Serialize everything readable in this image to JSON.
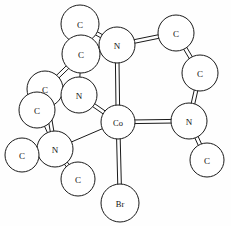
{
  "figure": {
    "kind": "molecular-structure-diagram",
    "center_atom": "Co",
    "axial_ligand": "Br",
    "style": {
      "circle_fill": "#ffffff",
      "stroke": "#1a1a1a",
      "background": "#fefefe"
    }
  },
  "atoms": [
    {
      "id": "C1",
      "label": "C",
      "x": 80,
      "y": 24,
      "r": 19
    },
    {
      "id": "C2",
      "label": "C",
      "x": 81,
      "y": 54,
      "r": 19
    },
    {
      "id": "N1",
      "label": "N",
      "x": 117,
      "y": 45,
      "r": 18
    },
    {
      "id": "C3",
      "label": "C",
      "x": 176,
      "y": 33,
      "r": 18
    },
    {
      "id": "C4",
      "label": "C",
      "x": 200,
      "y": 73,
      "r": 18
    },
    {
      "id": "C5",
      "label": "C",
      "x": 45,
      "y": 89,
      "r": 18
    },
    {
      "id": "C6",
      "label": "C",
      "x": 37,
      "y": 110,
      "r": 18
    },
    {
      "id": "N2",
      "label": "N",
      "x": 79,
      "y": 95,
      "r": 18
    },
    {
      "id": "Co",
      "label": "Co",
      "x": 118,
      "y": 122,
      "r": 17
    },
    {
      "id": "N3",
      "label": "N",
      "x": 189,
      "y": 121,
      "r": 18
    },
    {
      "id": "N4",
      "label": "N",
      "x": 55,
      "y": 149,
      "r": 18
    },
    {
      "id": "C7",
      "label": "C",
      "x": 22,
      "y": 155,
      "r": 17
    },
    {
      "id": "C8",
      "label": "C",
      "x": 78,
      "y": 179,
      "r": 17
    },
    {
      "id": "C9",
      "label": "C",
      "x": 207,
      "y": 160,
      "r": 17
    },
    {
      "id": "Br",
      "label": "Br",
      "x": 120,
      "y": 203,
      "r": 19
    }
  ],
  "bonds": [
    {
      "from": "C1",
      "to": "N1",
      "type": "double"
    },
    {
      "from": "C1",
      "to": "C2",
      "type": "single"
    },
    {
      "from": "C2",
      "to": "N1",
      "type": "double"
    },
    {
      "from": "C2",
      "to": "C5",
      "type": "double"
    },
    {
      "from": "C2",
      "to": "N2",
      "type": "single"
    },
    {
      "from": "N1",
      "to": "C3",
      "type": "double"
    },
    {
      "from": "N1",
      "to": "Co",
      "type": "double"
    },
    {
      "from": "C3",
      "to": "C4",
      "type": "double"
    },
    {
      "from": "C4",
      "to": "N3",
      "type": "double"
    },
    {
      "from": "N3",
      "to": "Co",
      "type": "double"
    },
    {
      "from": "N3",
      "to": "C9",
      "type": "double"
    },
    {
      "from": "C5",
      "to": "N2",
      "type": "single"
    },
    {
      "from": "C5",
      "to": "N4",
      "type": "double"
    },
    {
      "from": "C6",
      "to": "N4",
      "type": "single"
    },
    {
      "from": "N2",
      "to": "Co",
      "type": "double"
    },
    {
      "from": "N4",
      "to": "Co",
      "type": "single"
    },
    {
      "from": "N4",
      "to": "C7",
      "type": "double"
    },
    {
      "from": "N4",
      "to": "C8",
      "type": "double"
    },
    {
      "from": "Co",
      "to": "Br",
      "type": "double"
    }
  ],
  "labels": {
    "carbon": "C",
    "nitrogen": "N",
    "cobalt": "Co",
    "bromine": "Br"
  }
}
